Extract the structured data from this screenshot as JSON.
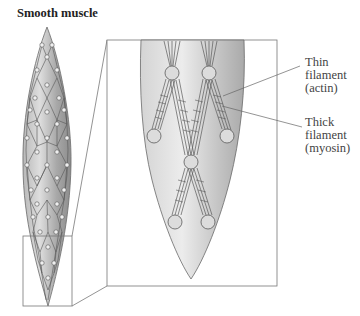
{
  "figure": {
    "title": "Smooth muscle",
    "labels": {
      "thin": {
        "line1": "Thin",
        "line2": "filament",
        "line3": "(actin)"
      },
      "thick": {
        "line1": "Thick",
        "line2": "filament",
        "line3": "(myosin)"
      }
    },
    "colors": {
      "cell_fill_light": "#e6e6e6",
      "cell_fill_dark": "#9a9a9a",
      "outline": "#666666",
      "filament": "#555555",
      "dense_body_fill": "#dcdcdc",
      "box_stroke": "#777777"
    }
  }
}
